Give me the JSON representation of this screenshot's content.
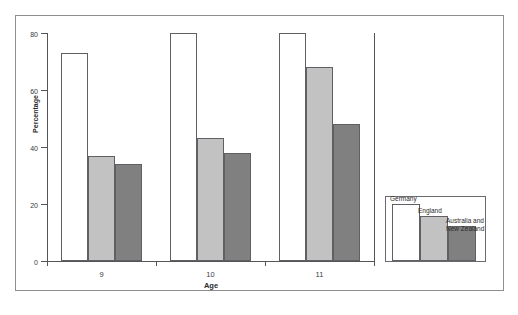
{
  "chart_data": {
    "type": "bar",
    "title": "",
    "subtitle": "",
    "xlabel": "Age",
    "ylabel": "Percentage",
    "categories": [
      "9",
      "10",
      "11"
    ],
    "series": [
      {
        "name": "Germany",
        "values": [
          73,
          80,
          80
        ],
        "color": "#ffffff"
      },
      {
        "name": "England",
        "values": [
          37,
          43,
          68
        ],
        "color": "#c2c2c2"
      },
      {
        "name": "Australia and\nNew Zealand",
        "values": [
          34,
          38,
          48
        ],
        "color": "#808080"
      }
    ],
    "ylim": [
      0,
      80
    ],
    "yticks": [
      0,
      20,
      40,
      60,
      80
    ],
    "ytick_labels": [
      "0",
      "20",
      "40",
      "60",
      "80"
    ],
    "grid": false,
    "legend_position": "bottom-right-outside",
    "legend_style": "mini-bar-chart"
  },
  "axes": {
    "y_title": "Percentage",
    "x_title": "Age",
    "y_tick_labels": [
      "80",
      "60",
      "40",
      "20",
      "0"
    ],
    "x_tick_labels": [
      "9",
      "10",
      "11"
    ]
  },
  "legend": {
    "entries": [
      {
        "label": "Germany",
        "color": "#ffffff"
      },
      {
        "label": "England",
        "color": "#c2c2c2"
      },
      {
        "label": "Australia and\nNew Zealand",
        "color": "#808080"
      }
    ]
  }
}
